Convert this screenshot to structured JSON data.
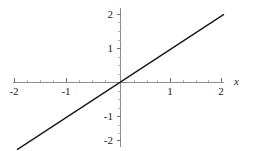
{
  "chart_data": {
    "type": "line",
    "title": "",
    "subtitle": "",
    "xlabel": "x",
    "ylabel": "",
    "xlim": [
      -2.2,
      2.2
    ],
    "ylim": [
      -2.2,
      2.2
    ],
    "grid": false,
    "legend": null,
    "legend_position": "none",
    "x_ticks": [
      -2,
      -1,
      1,
      2
    ],
    "x_tick_labels": [
      "-2",
      "-1",
      "1",
      "2"
    ],
    "y_ticks": [
      2,
      1,
      -1,
      -2
    ],
    "y_tick_labels": [
      "2",
      "1",
      "-1",
      "-2"
    ],
    "series": [
      {
        "name": "y = x",
        "x": [
          -2,
          -1,
          0,
          1,
          2
        ],
        "values": [
          -2,
          -1,
          0,
          1,
          2
        ],
        "color": "#1a1a1a",
        "line_width": 1.4,
        "style": "solid"
      }
    ],
    "annotations": []
  },
  "axes": {
    "x_axis_label": "x",
    "axis_color": "#8c8c8c",
    "tick_labels": {
      "x_neg2": "-2",
      "x_neg1": "-1",
      "x_pos1": "1",
      "x_pos2": "2",
      "y_pos2": "2",
      "y_pos1": "1",
      "y_neg1": "-1",
      "y_neg2": "-2"
    }
  },
  "style": {
    "background": "#ffffff",
    "line_color": "#1a1a1a",
    "text_color": "#1a1a1a"
  }
}
